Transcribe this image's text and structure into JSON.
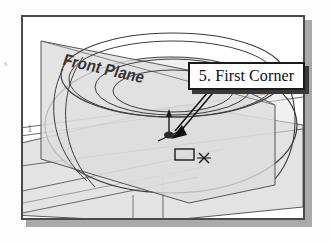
{
  "figure": {
    "kind": "cad-tutorial-illustration",
    "frame": {
      "border_color": "#4a4a4a",
      "shadow_color": "#a9a9a9",
      "background": "#ffffff"
    },
    "margin_artifact": "s",
    "inner_artifact": "1"
  },
  "callout": {
    "label": "5. First Corner",
    "box_fill": "#ffffff",
    "box_border": "#1a1a1a",
    "box_shadow": "#3a3a3a",
    "leader_style": "double-line-arrow",
    "leader_target": "first-corner-point"
  },
  "model": {
    "plane_label": "Front Plane",
    "plane_fill": "#dcdcdc",
    "plane_edge": "#555555",
    "body_fill": "#e2e2e2",
    "outline_color": "#3d3d3d",
    "ellipse_count": 4,
    "view": "isometric"
  },
  "sketch": {
    "origin_marker": "origin-icon",
    "axis_arrow": "y-axis-arrow",
    "cursor_tool": "rectangle-cursor",
    "cursor_crosshair": "crosshair-x"
  }
}
